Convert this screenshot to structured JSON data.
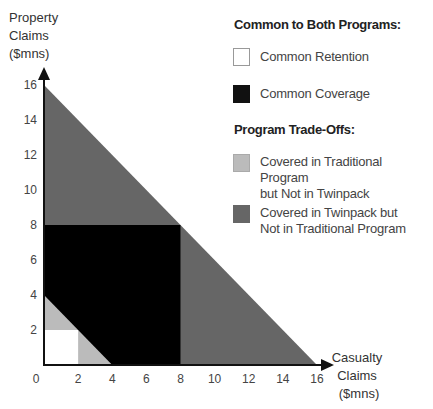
{
  "chart_data": {
    "type": "area",
    "title": "",
    "xlabel": "Casualty Claims ($mns)",
    "ylabel": "Property Claims ($mns)",
    "xlabel_lines": [
      "Casualty",
      "Claims",
      "($mns)"
    ],
    "ylabel_lines": [
      "Property",
      "Claims",
      "($mns)"
    ],
    "xlim": [
      0,
      16
    ],
    "ylim": [
      0,
      16
    ],
    "x_ticks": [
      0,
      2,
      4,
      6,
      8,
      10,
      12,
      14,
      16
    ],
    "y_ticks": [
      2,
      4,
      6,
      8,
      10,
      12,
      14,
      16
    ],
    "grid": false,
    "legend_position": "upper right",
    "regions": [
      {
        "name": "Covered in Twinpack but Not in Traditional Program",
        "color": "#666666",
        "shape": "triangle",
        "points": [
          [
            0,
            0
          ],
          [
            16,
            0
          ],
          [
            0,
            16
          ]
        ]
      },
      {
        "name": "Common Coverage",
        "color": "#000000",
        "shape": "rectangle",
        "points": [
          [
            0,
            0
          ],
          [
            8,
            0
          ],
          [
            8,
            8
          ],
          [
            0,
            8
          ]
        ]
      },
      {
        "name": "Covered in Traditional Program but Not in Twinpack",
        "color": "#bbbbbb",
        "shape": "triangle",
        "points": [
          [
            0,
            0
          ],
          [
            4,
            0
          ],
          [
            0,
            4
          ]
        ]
      },
      {
        "name": "Common Retention",
        "color": "#ffffff",
        "shape": "rectangle",
        "points": [
          [
            0,
            0
          ],
          [
            2,
            0
          ],
          [
            2,
            2
          ],
          [
            0,
            2
          ]
        ]
      }
    ]
  },
  "legend": {
    "group1_title": "Common to Both Programs:",
    "group2_title": "Program Trade-Offs:",
    "items": [
      {
        "label": "Common Retention",
        "color": "#ffffff"
      },
      {
        "label": "Common Coverage",
        "color": "#111111"
      },
      {
        "label_line1": "Covered in Traditional Program",
        "label_line2": "but Not in Twinpack",
        "color": "#bbbbbb"
      },
      {
        "label_line1": "Covered in Twinpack but",
        "label_line2": "Not in Traditional Program",
        "color": "#666666"
      }
    ]
  }
}
